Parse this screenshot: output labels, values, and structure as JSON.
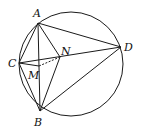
{
  "figure": {
    "type": "geometry",
    "circle": {
      "cx": 71,
      "cy": 64,
      "r": 52
    },
    "points": {
      "A": {
        "label": "A",
        "x": 38,
        "y": 23
      },
      "B": {
        "label": "B",
        "x": 40,
        "y": 111
      },
      "C": {
        "label": "C",
        "x": 19,
        "y": 63
      },
      "D": {
        "label": "D",
        "x": 121,
        "y": 47
      },
      "M": {
        "label": "M",
        "x": 39,
        "y": 66
      },
      "N": {
        "label": "N",
        "x": 60,
        "y": 57
      }
    },
    "segments": [
      [
        "A",
        "C"
      ],
      [
        "A",
        "B"
      ],
      [
        "A",
        "N"
      ],
      [
        "A",
        "D"
      ],
      [
        "C",
        "B"
      ],
      [
        "C",
        "D"
      ],
      [
        "C",
        "M"
      ],
      [
        "N",
        "B"
      ],
      [
        "B",
        "D"
      ]
    ],
    "dashed_segments": [
      [
        "M",
        "N"
      ]
    ]
  }
}
